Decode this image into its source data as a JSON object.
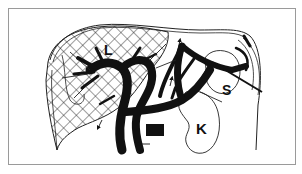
{
  "figure": {
    "type": "anatomical line drawing",
    "labels": {
      "liver": "L",
      "spleen": "S",
      "kidney": "K"
    },
    "colors": {
      "ink": "#111111",
      "frame": "#9a9a9a",
      "background": "#ffffff"
    }
  }
}
